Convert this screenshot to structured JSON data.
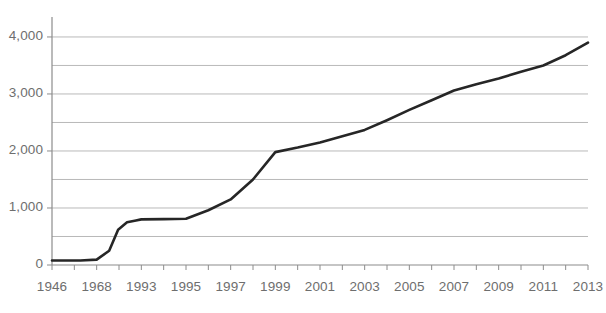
{
  "chart_data": {
    "type": "line",
    "title": "",
    "subtitle": "",
    "xlabel": "",
    "ylabel": "",
    "grid": true,
    "legend": false,
    "legend_position": "none",
    "line_color": "#262626",
    "grid_color": "#b9b9b9",
    "axis_color": "#8c8c8c",
    "tick_label_color": "#6e6e6e",
    "background_color": "#ffffff",
    "ylim": [
      0,
      4350
    ],
    "y_major_ticks": [
      0,
      1000,
      2000,
      3000,
      4000
    ],
    "y_major_tick_labels": [
      "0",
      "1,000",
      "2,000",
      "3,000",
      "4,000"
    ],
    "y_gridlines": [
      0,
      500,
      1000,
      1500,
      2000,
      2500,
      3000,
      3500,
      4000
    ],
    "x_tick_labels": [
      "1946",
      "1968",
      "1993",
      "1995",
      "1997",
      "1999",
      "2001",
      "2003",
      "2005",
      "2007",
      "2009",
      "2011",
      "2013"
    ],
    "x_minor_tick_count": 25,
    "categories": [
      "1946",
      "1968",
      "1993",
      "1995",
      "1997",
      "1999",
      "2001",
      "2003",
      "2005",
      "2007",
      "2009",
      "2011",
      "2013"
    ],
    "values": [
      80,
      95,
      800,
      810,
      1150,
      1980,
      2150,
      2370,
      2720,
      3060,
      3270,
      3500,
      3900
    ],
    "series": [
      {
        "name": "Series 1",
        "x": [
          1946,
          1960,
          1968,
          1975,
          1980,
          1985,
          1990,
          1993,
          1994,
          1995,
          1996,
          1997,
          1998,
          1999,
          2000,
          2001,
          2002,
          2003,
          2004,
          2005,
          2006,
          2007,
          2008,
          2009,
          2010,
          2011,
          2012,
          2013
        ],
        "values": [
          80,
          80,
          95,
          250,
          620,
          750,
          780,
          800,
          805,
          810,
          960,
          1150,
          1500,
          1980,
          2060,
          2150,
          2260,
          2370,
          2540,
          2720,
          2890,
          3060,
          3170,
          3270,
          3390,
          3500,
          3680,
          3900
        ]
      }
    ]
  }
}
